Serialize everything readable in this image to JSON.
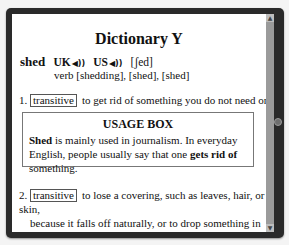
{
  "title": "Dictionary Y",
  "entry": {
    "headword": "shed",
    "pronunciations": [
      {
        "label": "UK",
        "icon": "speaker-icon"
      },
      {
        "label": "US",
        "icon": "speaker-icon"
      }
    ],
    "speaker_glyph": "◀))",
    "ipa": "[ʃed]",
    "forms": "verb [shedding], [shed], [shed]"
  },
  "definitions": [
    {
      "number": "1.",
      "tag": "transitive",
      "text": "to get rid of something you do not need or want"
    },
    {
      "number": "2.",
      "tag": "transitive",
      "lines": [
        "to lose a covering, such as leaves, hair, or skin,",
        "because it falls off naturally, or to drop something in",
        "a natural way or by accident"
      ]
    }
  ],
  "usage_box": {
    "title": "USAGE BOX",
    "segments": [
      {
        "text": "Shed",
        "bold": true
      },
      {
        "text": " is mainly used in journalism. In everyday English, people usually say that one ",
        "bold": false
      },
      {
        "text": "gets rid of",
        "bold": true
      },
      {
        "text": " something.",
        "bold": false
      }
    ]
  },
  "scrollbar": {
    "up_glyph": "▲",
    "down_glyph": "▼"
  },
  "colors": {
    "frame": "#2a2a2a",
    "content_bg": "#ffffff",
    "scrollbar": "#8a8a8a",
    "button": "#6f6f6f"
  }
}
